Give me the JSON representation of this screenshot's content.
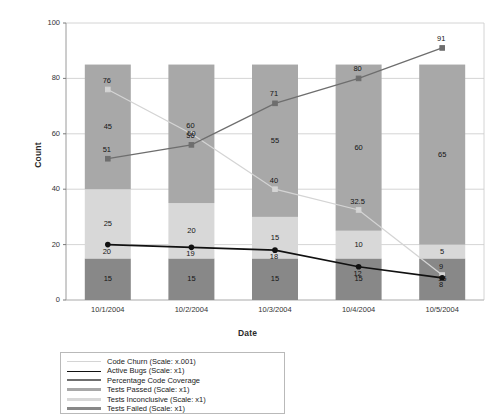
{
  "chart_data": {
    "type": "bar",
    "title": "",
    "xlabel": "Date",
    "ylabel": "Count",
    "ylim": [
      0,
      100
    ],
    "yticks": [
      0,
      20,
      40,
      60,
      80,
      100
    ],
    "grid": true,
    "legend_position": "bottom-left",
    "stacked": true,
    "categories": [
      "10/1/2004",
      "10/2/2004",
      "10/3/2004",
      "10/4/2004",
      "10/5/2004"
    ],
    "series": [
      {
        "name": "Tests Failed (Scale: x1)",
        "type": "bar",
        "color": "#888888",
        "values": [
          15,
          15,
          15,
          15,
          15
        ]
      },
      {
        "name": "Tests Inconclusive (Scale: x1)",
        "type": "bar",
        "color": "#d8d8d8",
        "values": [
          25,
          20,
          15,
          10,
          5
        ]
      },
      {
        "name": "Tests Passed (Scale: x1)",
        "type": "bar",
        "color": "#a8a8a8",
        "values": [
          45,
          50,
          55,
          60,
          65
        ]
      },
      {
        "name": "Code Churn (Scale: x.001)",
        "type": "line",
        "color": "#d4d4d4",
        "values": [
          76,
          60,
          40,
          32.5,
          9
        ]
      },
      {
        "name": "Active Bugs (Scale: x1)",
        "type": "line",
        "color": "#111111",
        "values": [
          20,
          19,
          18,
          12,
          8
        ]
      },
      {
        "name": "Percentage Code Coverage",
        "type": "line",
        "color": "#6e6e6e",
        "values": [
          51,
          56,
          71,
          80,
          91
        ]
      }
    ]
  },
  "legend": {
    "items": [
      {
        "label": "Code Churn (Scale: x.001)",
        "color": "#d4d4d4",
        "thickness": 1
      },
      {
        "label": "Active Bugs (Scale: x1)",
        "color": "#111111",
        "thickness": 1.4
      },
      {
        "label": "Percentage Code Coverage",
        "color": "#6e6e6e",
        "thickness": 2
      },
      {
        "label": "Tests Passed (Scale: x1)",
        "color": "#a8a8a8",
        "thickness": 3.4
      },
      {
        "label": "Tests Inconclusive (Scale: x1)",
        "color": "#d8d8d8",
        "thickness": 3.4
      },
      {
        "label": "Tests Failed (Scale: x1)",
        "color": "#888888",
        "thickness": 3.4
      }
    ]
  },
  "axes": {
    "y_title": "Count",
    "x_title": "Date",
    "y_ticks": [
      "0",
      "20",
      "40",
      "60",
      "80",
      "100"
    ],
    "x_ticks": [
      "10/1/2004",
      "10/2/2004",
      "10/3/2004",
      "10/4/2004",
      "10/5/2004"
    ]
  },
  "point_labels": {
    "bar_segments": [
      [
        "15",
        "25",
        "45"
      ],
      [
        "15",
        "20",
        "50"
      ],
      [
        "15",
        "15",
        "55"
      ],
      [
        "15",
        "10",
        "60"
      ],
      [
        "15",
        "5",
        "65"
      ]
    ],
    "code_churn": [
      "76",
      "60",
      "40",
      "32.5",
      "9"
    ],
    "active_bugs": [
      "20",
      "19",
      "18",
      "12",
      "8"
    ],
    "code_coverage": [
      "51",
      "56",
      "71",
      "80",
      "91"
    ]
  }
}
